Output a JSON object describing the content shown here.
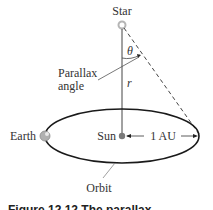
{
  "diagram": {
    "labels": {
      "star": "Star",
      "theta": "θ",
      "parallax_line1": "Parallax",
      "parallax_line2": "angle",
      "r": "r",
      "earth": "Earth",
      "sun": "Sun",
      "au": "1 AU",
      "orbit": "Orbit"
    },
    "caption": "Figure 12.12   The parallax",
    "colors": {
      "line": "#333333",
      "orbit": "#1a1a1a",
      "sun": "#7a7a7a",
      "earth": "#b0b0b0",
      "star": "#c8c8c8"
    }
  }
}
